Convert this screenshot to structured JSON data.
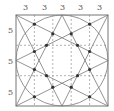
{
  "figure": {
    "top_labels": [
      "3",
      "3",
      "3",
      "3",
      "3"
    ],
    "left_labels": [
      "5",
      "5",
      "5"
    ],
    "colors": {
      "line": "#7a7a7a",
      "dash": "#9a9a9a",
      "dot": "#333333"
    }
  }
}
